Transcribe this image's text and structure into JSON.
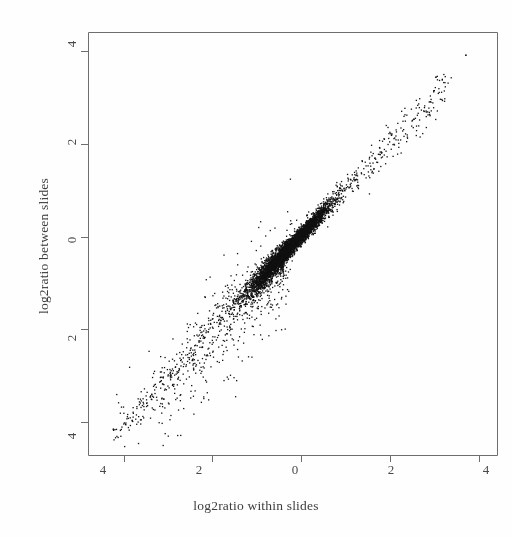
{
  "chart_data": {
    "type": "scatter",
    "title": "",
    "xlabel": "log2ratio within slides",
    "ylabel": "log2ratio between slides",
    "xlim": [
      -4.8,
      4.4
    ],
    "ylim": [
      -4.7,
      4.4
    ],
    "xticks": [
      -4,
      -2,
      0,
      2,
      4
    ],
    "yticks": [
      -4,
      -2,
      0,
      2,
      4
    ],
    "xtick_labels": [
      "4",
      "2",
      "0",
      "2",
      "4"
    ],
    "ytick_labels": [
      "4",
      "2",
      "0",
      "2",
      "4"
    ],
    "grid": false,
    "legend": null,
    "marker": {
      "shape": "dot",
      "size_px": 1.3,
      "color": "#111111"
    },
    "box": true,
    "n_points": 5200,
    "points_summary": {
      "correlation": 0.97,
      "core_range": [
        -2.2,
        1.6
      ],
      "tail_min": -4.2,
      "tail_max": 3.95,
      "outlier": [
        3.7,
        3.9
      ]
    },
    "series": [
      {
        "name": "log2ratio pairs",
        "x": [
          -4.15,
          -4.05,
          -3.95,
          -3.85,
          -3.7,
          -3.55,
          -3.4,
          -3.3,
          -3.15,
          -3.0,
          -2.9,
          -2.8,
          -2.7,
          -2.6,
          -2.5,
          -2.4,
          -2.3,
          -2.2,
          -2.1,
          -2.0,
          -1.9,
          -1.8,
          -1.7,
          -1.6,
          -1.5,
          -1.4,
          -1.3,
          -1.2,
          -1.1,
          -1.0,
          -0.9,
          -0.8,
          -0.7,
          -0.6,
          -0.5,
          -0.4,
          -0.3,
          -0.2,
          -0.1,
          0.0,
          0.1,
          0.2,
          0.3,
          0.4,
          0.5,
          0.6,
          0.7,
          0.8,
          0.9,
          1.0,
          1.1,
          1.2,
          1.35,
          1.5,
          1.65,
          1.8,
          1.95,
          2.1,
          2.3,
          2.5,
          2.7,
          2.9,
          3.1,
          3.3,
          3.7
        ],
        "y": [
          -4.3,
          -4.15,
          -4.05,
          -3.9,
          -3.7,
          -3.6,
          -3.45,
          -3.3,
          -3.1,
          -3.0,
          -2.85,
          -2.75,
          -2.65,
          -2.55,
          -2.45,
          -2.35,
          -2.25,
          -2.15,
          -2.05,
          -1.95,
          -1.85,
          -1.75,
          -1.65,
          -1.55,
          -1.45,
          -1.35,
          -1.25,
          -1.15,
          -1.05,
          -0.95,
          -0.85,
          -0.75,
          -0.65,
          -0.55,
          -0.45,
          -0.35,
          -0.27,
          -0.18,
          -0.08,
          0.02,
          0.12,
          0.22,
          0.32,
          0.42,
          0.52,
          0.62,
          0.72,
          0.82,
          0.92,
          1.02,
          1.12,
          1.22,
          1.37,
          1.52,
          1.68,
          1.82,
          1.98,
          2.12,
          2.3,
          2.5,
          2.72,
          2.9,
          3.1,
          3.3,
          3.9
        ]
      }
    ]
  },
  "axes": {
    "x_tick_labels": [
      "4",
      "2",
      "0",
      "2",
      "4"
    ],
    "y_tick_labels": [
      "4",
      "2",
      "0",
      "2",
      "4"
    ]
  }
}
